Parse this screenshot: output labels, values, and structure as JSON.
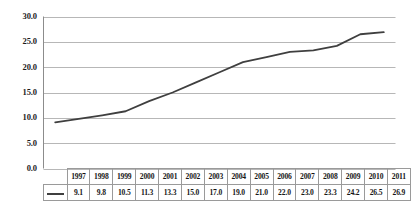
{
  "chart_data": {
    "type": "line",
    "title": "",
    "subtitle": "",
    "xlabel": "",
    "ylabel": "",
    "categories": [
      "1997",
      "1998",
      "1999",
      "2000",
      "2001",
      "2002",
      "2003",
      "2004",
      "2005",
      "2006",
      "2007",
      "2008",
      "2009",
      "2010",
      "2011"
    ],
    "values": [
      9.1,
      9.8,
      10.5,
      11.3,
      13.3,
      15.0,
      17.0,
      19.0,
      21.0,
      22.0,
      23.0,
      23.3,
      24.2,
      26.5,
      26.9
    ],
    "series": [
      {
        "name": "",
        "values": [
          9.1,
          9.8,
          10.5,
          11.3,
          13.3,
          15.0,
          17.0,
          19.0,
          21.0,
          22.0,
          23.0,
          23.3,
          24.2,
          26.5,
          26.9
        ]
      }
    ],
    "ylim": [
      0.0,
      30.0
    ],
    "ytick_labels": [
      "30.0",
      "25.0",
      "20.0",
      "15.0",
      "10.0",
      "5.0",
      "0.0"
    ],
    "ytick_values": [
      30.0,
      25.0,
      20.0,
      15.0,
      10.0,
      5.0,
      0.0
    ],
    "grid": true,
    "grid_axis": "y",
    "legend": "data-table",
    "legend_position": "bottom",
    "annotations": [],
    "colors": {
      "line": "#3f3f3f",
      "grid": "#b7b7b7",
      "axis": "#8c8c8c",
      "table_border": "#9a9a9a",
      "text": "#161616",
      "background": "#ffffff"
    }
  },
  "data_table": {
    "year_row_label": "",
    "value_row_label": "",
    "years": [
      "1997",
      "1998",
      "1999",
      "2000",
      "2001",
      "2002",
      "2003",
      "2004",
      "2005",
      "2006",
      "2007",
      "2008",
      "2009",
      "2010",
      "2011"
    ],
    "values": [
      "9.1",
      "9.8",
      "10.5",
      "11.3",
      "13.3",
      "15.0",
      "17.0",
      "19.0",
      "21.0",
      "22.0",
      "23.0",
      "23.3",
      "24.2",
      "26.5",
      "26.9"
    ],
    "legend_swatch": "line-swatch"
  },
  "yaxis": {
    "labels": [
      "30.0",
      "25.0",
      "20.0",
      "15.0",
      "10.0",
      "5.0",
      "0.0"
    ]
  }
}
